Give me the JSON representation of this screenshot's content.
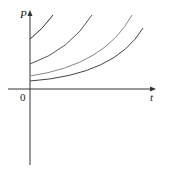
{
  "figure": {
    "y_axis_label": "P",
    "x_axis_label": "t",
    "origin_label": "0"
  },
  "curves": [
    {
      "name": "curve-1",
      "color": "#333333"
    },
    {
      "name": "curve-2",
      "color": "#555555"
    },
    {
      "name": "curve-3",
      "color": "#888888"
    },
    {
      "name": "curve-4",
      "color": "#444444"
    }
  ]
}
